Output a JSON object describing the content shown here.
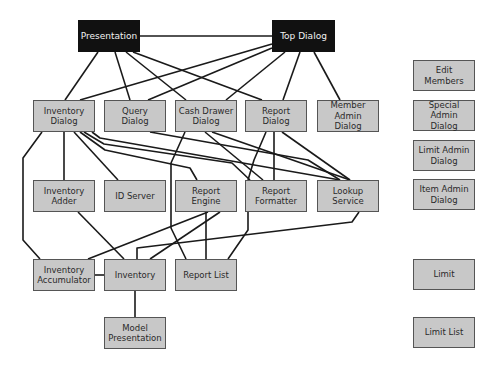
{
  "diagram": {
    "colors": {
      "box_fill": "#c8c8c8",
      "box_border": "#555555",
      "top_fill": "#111111",
      "top_text": "#f2f2f2",
      "line": "#1a1a1a"
    },
    "nodes": [
      {
        "id": "presentation",
        "label": "Presentation",
        "x": 78,
        "y": 20,
        "w": 62,
        "h": 32,
        "dark": true
      },
      {
        "id": "top_dialog",
        "label": "Top Dialog",
        "x": 272,
        "y": 20,
        "w": 63,
        "h": 32,
        "dark": true
      },
      {
        "id": "inventory_dialog",
        "label": "Inventory\nDialog",
        "x": 33,
        "y": 100,
        "w": 62,
        "h": 32
      },
      {
        "id": "query_dialog",
        "label": "Query\nDialog",
        "x": 104,
        "y": 100,
        "w": 62,
        "h": 32
      },
      {
        "id": "cash_drawer_dialog",
        "label": "Cash Drawer\nDialog",
        "x": 175,
        "y": 100,
        "w": 62,
        "h": 32
      },
      {
        "id": "report_dialog",
        "label": "Report\nDialog",
        "x": 245,
        "y": 100,
        "w": 62,
        "h": 32
      },
      {
        "id": "member_admin_dialog",
        "label": "Member Admin\nDialog",
        "x": 317,
        "y": 100,
        "w": 62,
        "h": 32
      },
      {
        "id": "inventory_adder",
        "label": "Inventory\nAdder",
        "x": 33,
        "y": 180,
        "w": 62,
        "h": 32
      },
      {
        "id": "id_server",
        "label": "ID Server",
        "x": 104,
        "y": 180,
        "w": 62,
        "h": 32
      },
      {
        "id": "report_engine",
        "label": "Report\nEngine",
        "x": 175,
        "y": 180,
        "w": 62,
        "h": 32
      },
      {
        "id": "report_formatter",
        "label": "Report\nFormatter",
        "x": 245,
        "y": 180,
        "w": 62,
        "h": 32
      },
      {
        "id": "lookup_service",
        "label": "Lookup\nService",
        "x": 317,
        "y": 180,
        "w": 62,
        "h": 32
      },
      {
        "id": "inventory_accumulator",
        "label": "Inventory\nAccumulator",
        "x": 33,
        "y": 259,
        "w": 62,
        "h": 32
      },
      {
        "id": "inventory",
        "label": "Inventory",
        "x": 104,
        "y": 259,
        "w": 62,
        "h": 32
      },
      {
        "id": "report_list",
        "label": "Report List",
        "x": 175,
        "y": 259,
        "w": 62,
        "h": 32
      },
      {
        "id": "model_presentation",
        "label": "Model\nPresentation",
        "x": 104,
        "y": 317,
        "w": 62,
        "h": 32
      },
      {
        "id": "edit_members",
        "label": "Edit\nMembers",
        "x": 413,
        "y": 60,
        "w": 62,
        "h": 31
      },
      {
        "id": "special_admin_dialog",
        "label": "Special Admin\nDialog",
        "x": 413,
        "y": 100,
        "w": 62,
        "h": 31
      },
      {
        "id": "limit_admin_dialog",
        "label": "Limit Admin\nDialog",
        "x": 413,
        "y": 140,
        "w": 62,
        "h": 31
      },
      {
        "id": "item_admin_dialog",
        "label": "Item Admin\nDialog",
        "x": 413,
        "y": 179,
        "w": 62,
        "h": 31
      },
      {
        "id": "limit",
        "label": "Limit",
        "x": 413,
        "y": 259,
        "w": 62,
        "h": 31
      },
      {
        "id": "limit_list",
        "label": "Limit List",
        "x": 413,
        "y": 317,
        "w": 62,
        "h": 31
      }
    ],
    "edges": [
      "140,36 272,36",
      "98,52 65,100",
      "115,52 130,100",
      "126,52 186,100",
      "133,52 262,100",
      "272,44 80,100",
      "272,48 148,100",
      "285,52 226,100",
      "300,52 283,100",
      "314,52 340,100",
      "64,132 64,180",
      "42,132 23,158 23,240 40,259",
      "74,132 118,180",
      "80,132 105,150 190,168 197,180",
      "84,132 104,144 232,163 250,180",
      "92,132 100,138 340,180",
      "150,132 308,160 340,180",
      "185,132 171,163 171,228 186,259",
      "205,132 263,180",
      "212,132 350,180",
      "266,132 254,160 248,180",
      "274,132 274,180",
      "282,132 350,180",
      "78,212 124,259",
      "208,212 88,259",
      "220,212 150,259",
      "206,212 206,259",
      "248,212 248,230 228,259",
      "359,212 352,222 137,248 137,259",
      "95,275 104,275",
      "135,291 135,317"
    ]
  }
}
